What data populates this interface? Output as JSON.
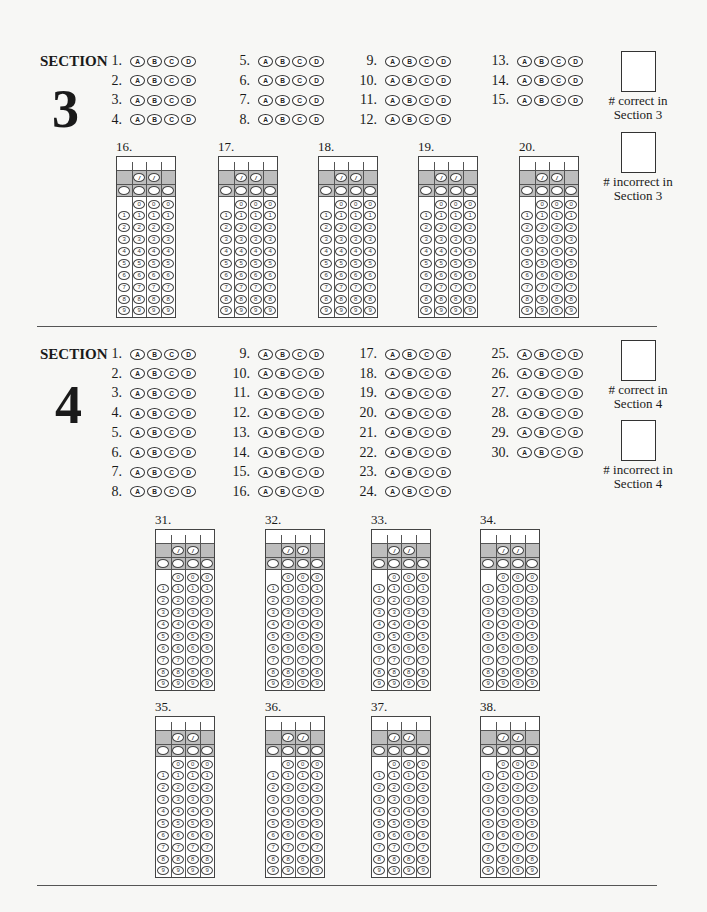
{
  "section3": {
    "label": "SECTION",
    "number": "3",
    "bubble_letters": [
      "A",
      "B",
      "C",
      "D"
    ],
    "multiple_choice_columns": [
      [
        "1.",
        "2.",
        "3.",
        "4."
      ],
      [
        "5.",
        "6.",
        "7.",
        "8."
      ],
      [
        "9.",
        "10.",
        "11.",
        "12."
      ],
      [
        "13.",
        "14.",
        "15."
      ]
    ],
    "score_boxes": [
      {
        "line1": "# correct in",
        "line2": "Section 3"
      },
      {
        "line1": "# incorrect in",
        "line2": "Section 3"
      }
    ],
    "grid_in_questions": [
      "16.",
      "17.",
      "18.",
      "19.",
      "20."
    ]
  },
  "section4": {
    "label": "SECTION",
    "number": "4",
    "bubble_letters": [
      "A",
      "B",
      "C",
      "D"
    ],
    "multiple_choice_columns": [
      [
        "1.",
        "2.",
        "3.",
        "4.",
        "5.",
        "6.",
        "7.",
        "8."
      ],
      [
        "9.",
        "10.",
        "11.",
        "12.",
        "13.",
        "14.",
        "15.",
        "16."
      ],
      [
        "17.",
        "18.",
        "19.",
        "20.",
        "21.",
        "22.",
        "23.",
        "24."
      ],
      [
        "25.",
        "26.",
        "27.",
        "28.",
        "29.",
        "30."
      ]
    ],
    "score_boxes": [
      {
        "line1": "# correct in",
        "line2": "Section 4"
      },
      {
        "line1": "# incorrect in",
        "line2": "Section 4"
      }
    ],
    "grid_in_questions": [
      "31.",
      "32.",
      "33.",
      "34.",
      "35.",
      "36.",
      "37.",
      "38."
    ]
  },
  "grid_in": {
    "slash_symbol": "/",
    "digits": [
      "0",
      "1",
      "2",
      "3",
      "4",
      "5",
      "6",
      "7",
      "8",
      "9"
    ],
    "shade_color": "#bdbdbd"
  }
}
